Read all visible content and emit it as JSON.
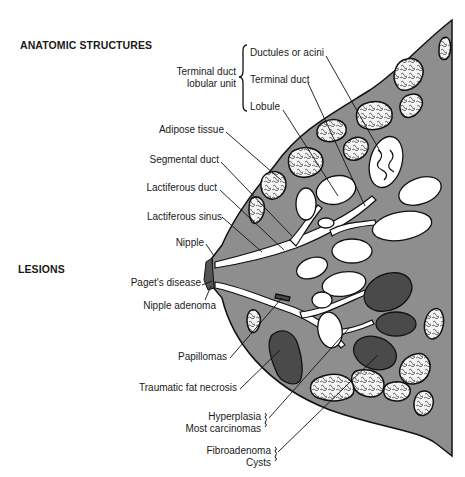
{
  "page_header": {
    "text": "Chapter 23  The Breast",
    "page_number": "223"
  },
  "sections": {
    "anatomic": "ANATOMIC STRUCTURES",
    "lesions": "LESIONS"
  },
  "tdlu": {
    "group_label_line1": "Terminal duct",
    "group_label_line2": "lobular unit",
    "items": [
      "Ductules or acini",
      "Terminal duct",
      "Lobule"
    ]
  },
  "anatomic_labels": [
    "Adipose tissue",
    "Segmental duct",
    "Lactiferous duct",
    "Lactiferous sinus",
    "Nipple"
  ],
  "lesion_labels": [
    "Paget's disease",
    "Nipple adenoma",
    "Papillomas",
    "Traumatic fat necrosis"
  ],
  "lesion_groups": [
    {
      "lines": [
        "Hyperplasia",
        "Most carcinomas"
      ]
    },
    {
      "lines": [
        "Fibroadenoma",
        "Cysts"
      ]
    }
  ],
  "colors": {
    "tissue": "#8e8e8e",
    "lesion_dark": "#4a4a4a",
    "outline": "#111111",
    "lobule_fill": "#ffffff",
    "fat_fill": "#f2f2f2"
  }
}
